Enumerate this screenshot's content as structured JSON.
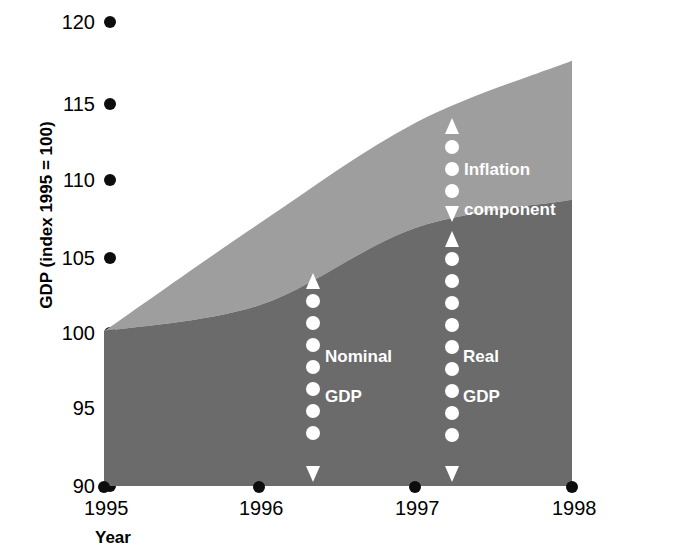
{
  "chart_data": {
    "type": "area",
    "title": "",
    "subtitle": "",
    "xlabel": "Year",
    "ylabel": "GDP (index 1995 = 100)",
    "x": [
      1995,
      1996,
      1997,
      1998
    ],
    "xticklabels": [
      "1995",
      "1996",
      "1997",
      "1998"
    ],
    "xlim": [
      1995,
      1998
    ],
    "yticklabels": [
      "90",
      "95",
      "100",
      "105",
      "110",
      "115",
      "120"
    ],
    "yticks": [
      90,
      95,
      100,
      105,
      110,
      115,
      120
    ],
    "ylim": [
      90,
      120
    ],
    "grid": false,
    "legend": "none",
    "stacked": true,
    "series": [
      {
        "name": "Real GDP",
        "color": "#6b6b6b",
        "values": [
          100,
          101.7,
          106.7,
          108.5
        ]
      },
      {
        "name": "Inflation component",
        "color": "#9e9e9e",
        "values": [
          0,
          5.3,
          6.8,
          9.0
        ]
      }
    ],
    "derived_series": [
      {
        "name": "Nominal GDP",
        "values": [
          100,
          107.0,
          113.5,
          117.5
        ]
      }
    ],
    "annotations": [
      {
        "id": "inflation",
        "label": "Inflation\ncomponent",
        "x": 1997.15,
        "band": "inflation-component"
      },
      {
        "id": "nominal",
        "label": "Nominal\nGDP",
        "x": 1996.3,
        "band": "nominal-gdp"
      },
      {
        "id": "real",
        "label": "Real\nGDP",
        "x": 1997.15,
        "band": "real-gdp"
      }
    ]
  },
  "axes": {
    "y": {
      "title": "GDP (index 1995 = 100)",
      "ticks": [
        {
          "label": "120",
          "value": 120
        },
        {
          "label": "115",
          "value": 115
        },
        {
          "label": "110",
          "value": 110
        },
        {
          "label": "105",
          "value": 105
        },
        {
          "label": "100",
          "value": 100
        },
        {
          "label": "95",
          "value": 95
        },
        {
          "label": "90",
          "value": 90
        }
      ]
    },
    "x": {
      "title": "Year",
      "ticks": [
        {
          "label": "1995",
          "value": 1995
        },
        {
          "label": "1996",
          "value": 1996
        },
        {
          "label": "1997",
          "value": 1997
        },
        {
          "label": "1998",
          "value": 1998
        }
      ]
    }
  },
  "annotations": {
    "inflation_line1": "Inflation",
    "inflation_line2": "component",
    "nominal_line1": "Nominal",
    "nominal_line2": "GDP",
    "real_line1": "Real",
    "real_line2": "GDP"
  },
  "colors": {
    "real_gdp_band": "#6b6b6b",
    "inflation_band": "#9e9e9e",
    "marker": "#0d0d0d",
    "annotation_text": "#ffffff",
    "background": "#ffffff"
  }
}
